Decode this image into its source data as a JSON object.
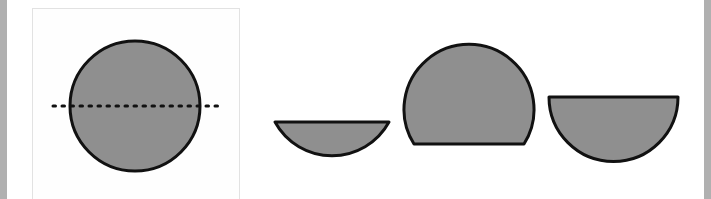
{
  "diagram": {
    "colors": {
      "fill": "#8f8f8f",
      "stroke": "#111111",
      "panel_border": "#e2e2e2",
      "side_strip": "#b0b0b0"
    },
    "shapes": [
      {
        "id": "full-circle",
        "type": "circle",
        "cx": 135,
        "cy": 105,
        "r": 65
      },
      {
        "id": "cut-line",
        "type": "dotted-line",
        "x1": 52,
        "y1": 106,
        "x2": 222,
        "y2": 106
      },
      {
        "id": "minor-segment",
        "type": "circular-segment",
        "orientation": "flat-top"
      },
      {
        "id": "major-segment",
        "type": "circular-segment",
        "orientation": "flat-bottom"
      },
      {
        "id": "semicircle",
        "type": "semicircle",
        "orientation": "flat-top"
      }
    ]
  }
}
